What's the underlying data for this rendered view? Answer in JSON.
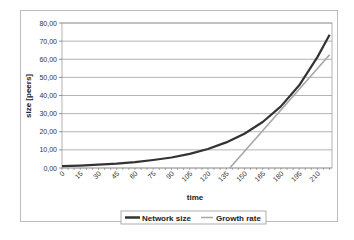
{
  "chart_data": {
    "type": "line",
    "title": "",
    "xlabel": "time",
    "ylabel": "size [peers]",
    "xlim": [
      0,
      222
    ],
    "ylim": [
      0,
      80
    ],
    "x_ticks": [
      "0",
      "15",
      "30",
      "45",
      "60",
      "75",
      "90",
      "105",
      "120",
      "135",
      "150",
      "165",
      "180",
      "195",
      "210"
    ],
    "y_ticks": [
      "0,00",
      "10,00",
      "20,00",
      "30,00",
      "40,00",
      "50,00",
      "60,00",
      "70,00",
      "80,00"
    ],
    "grid": true,
    "legend_position": "bottom",
    "series": [
      {
        "name": "Network size",
        "color": "#333333",
        "x": [
          0,
          15,
          30,
          45,
          60,
          75,
          90,
          105,
          120,
          135,
          150,
          165,
          180,
          195,
          210,
          220
        ],
        "y": [
          1.0,
          1.3,
          1.8,
          2.4,
          3.2,
          4.4,
          5.8,
          7.8,
          10.5,
          14.1,
          18.9,
          25.4,
          34.0,
          45.6,
          61.2,
          73.5
        ]
      },
      {
        "name": "Growth rate",
        "color": "#a6a6a6",
        "x": [
          138,
          220
        ],
        "y": [
          0,
          62.5
        ]
      }
    ]
  }
}
